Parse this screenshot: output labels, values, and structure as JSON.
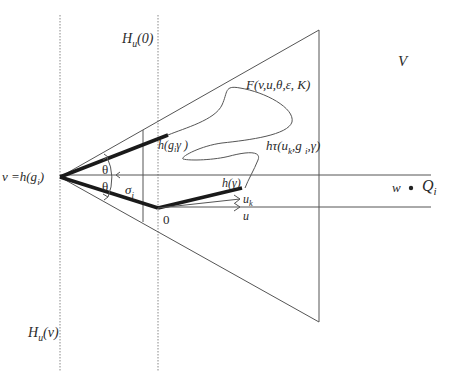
{
  "diagram": {
    "type": "geometric-figure",
    "colors": {
      "line": "#555555",
      "thick": "#1a1a1a",
      "dotted": "#888888",
      "text": "#2a2a2a"
    },
    "labels": {
      "hu0": {
        "main": "H",
        "sub": "u",
        "arg": "(0)"
      },
      "huv": {
        "main": "H",
        "sub": "u",
        "arg": "(v)"
      },
      "V": "V",
      "F": "F(v,u,θ,ε, K)",
      "vertex": {
        "main": "v =h(g",
        "sub": "i",
        "close": ")"
      },
      "hg": {
        "main": "h(g",
        "sub": "i",
        "rest": "γ )"
      },
      "htau": {
        "main": "hτ(u",
        "sub1": "k",
        "mid": ",g ",
        "sub2": "i",
        "rest": ",γ)"
      },
      "hgamma": "h(γ)",
      "theta1": "θ",
      "theta2": "θ",
      "sigma": {
        "main": "σ",
        "sub": "i"
      },
      "zero": "0",
      "uk": {
        "main": "u",
        "sub": "k"
      },
      "u": "u",
      "w": "w",
      "Q": {
        "main": "Q",
        "sub": "i"
      }
    }
  }
}
